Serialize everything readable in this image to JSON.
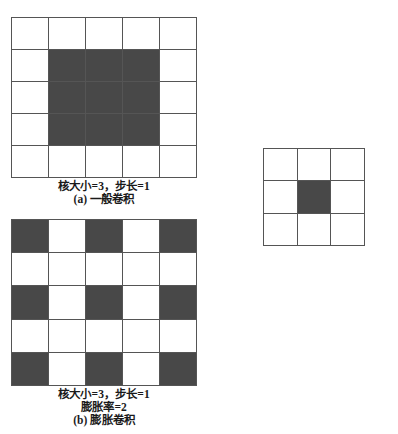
{
  "figure": {
    "background_color": "#ffffff",
    "fill_color": "#484848",
    "empty_color": "#ffffff",
    "line_color": "#555555"
  },
  "panel_a": {
    "id": "standard-convolution",
    "grid": {
      "rows": 5,
      "cols": 5,
      "filled_cells": [
        [
          1,
          1
        ],
        [
          1,
          2
        ],
        [
          1,
          3
        ],
        [
          2,
          1
        ],
        [
          2,
          2
        ],
        [
          2,
          3
        ],
        [
          3,
          1
        ],
        [
          3,
          2
        ],
        [
          3,
          3
        ]
      ]
    },
    "caption": {
      "params": "核大小=3，步长=1",
      "label": "(a) 一般卷积"
    }
  },
  "panel_b": {
    "id": "dilated-convolution",
    "grid": {
      "rows": 5,
      "cols": 5,
      "filled_cells": [
        [
          0,
          0
        ],
        [
          0,
          2
        ],
        [
          0,
          4
        ],
        [
          2,
          0
        ],
        [
          2,
          2
        ],
        [
          2,
          4
        ],
        [
          4,
          0
        ],
        [
          4,
          2
        ],
        [
          4,
          4
        ]
      ]
    },
    "caption": {
      "params": "核大小=3，步长=1",
      "dilation": "膨胀率=2",
      "label": "(b) 膨胀卷积"
    }
  },
  "panel_output": {
    "id": "output-feature-map",
    "grid": {
      "rows": 3,
      "cols": 3,
      "filled_cells": [
        [
          1,
          1
        ]
      ]
    }
  },
  "chart_data": {
    "type": "heatmap",
    "grids": [
      {
        "name": "(a) 一般卷积",
        "rows": 5,
        "cols": 5,
        "values": [
          [
            0,
            0,
            0,
            0,
            0
          ],
          [
            0,
            1,
            1,
            1,
            0
          ],
          [
            0,
            1,
            1,
            1,
            0
          ],
          [
            0,
            1,
            1,
            1,
            0
          ],
          [
            0,
            0,
            0,
            0,
            0
          ]
        ],
        "kernel_size": 3,
        "stride": 1,
        "dilation": 1
      },
      {
        "name": "(b) 膨胀卷积",
        "rows": 5,
        "cols": 5,
        "values": [
          [
            1,
            0,
            1,
            0,
            1
          ],
          [
            0,
            0,
            0,
            0,
            0
          ],
          [
            1,
            0,
            1,
            0,
            1
          ],
          [
            0,
            0,
            0,
            0,
            0
          ],
          [
            1,
            0,
            1,
            0,
            1
          ]
        ],
        "kernel_size": 3,
        "stride": 1,
        "dilation": 2
      },
      {
        "name": "输出特征图",
        "rows": 3,
        "cols": 3,
        "values": [
          [
            0,
            0,
            0
          ],
          [
            0,
            1,
            0
          ],
          [
            0,
            0,
            0
          ]
        ]
      }
    ],
    "legend": [
      {
        "swatch": "#484848",
        "meaning": "卷积核覆盖区域"
      },
      {
        "swatch": "#ffffff",
        "meaning": "未覆盖区域"
      }
    ],
    "grid_lines": true,
    "legend_position": "none"
  }
}
